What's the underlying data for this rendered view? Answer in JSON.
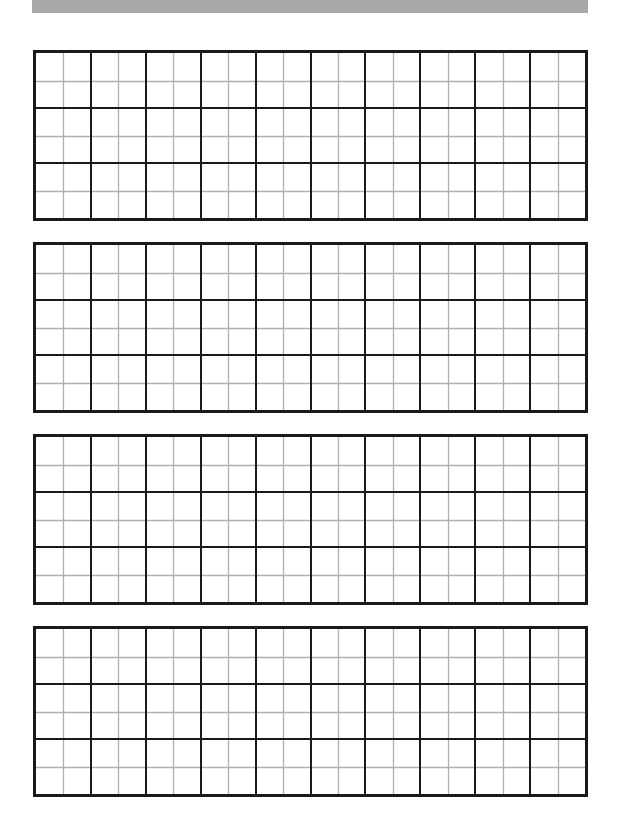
{
  "page": {
    "background": "#ffffff",
    "top_bar": {
      "color": "#a9a9a9"
    }
  },
  "grid": {
    "major_columns": 10,
    "major_rows": 3,
    "subdivisions": 2,
    "major_line_color": "#1a1a1a",
    "minor_line_color": "#b0b0b0",
    "boxes": [
      {
        "id": 1,
        "top": 50
      },
      {
        "id": 2,
        "top": 242
      },
      {
        "id": 3,
        "top": 434
      },
      {
        "id": 4,
        "top": 626
      }
    ]
  }
}
